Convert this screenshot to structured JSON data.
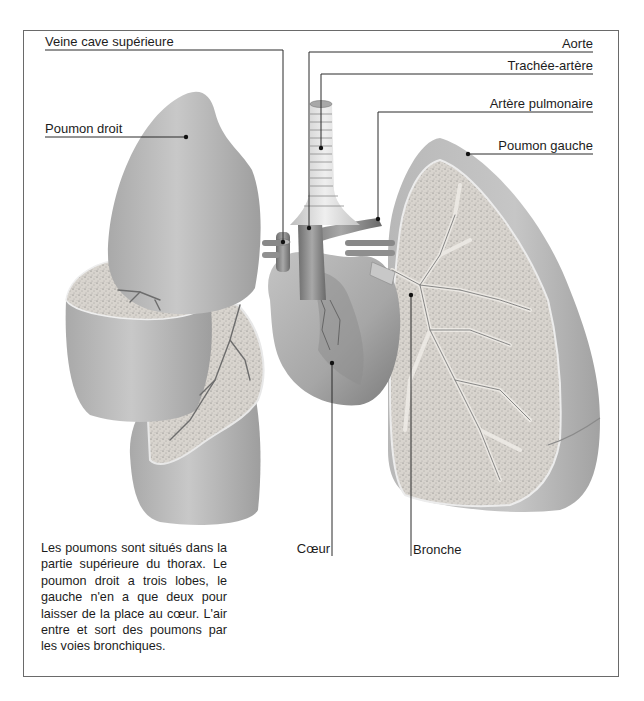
{
  "figure": {
    "labels": {
      "veine_cave_superieure": "Veine cave supérieure",
      "poumon_droit": "Poumon droit",
      "aorte": "Aorte",
      "trachee_artere": "Trachée-artère",
      "artere_pulmonaire": "Artère pulmonaire",
      "poumon_gauche": "Poumon gauche",
      "coeur": "Cœur",
      "bronche": "Bronche"
    },
    "caption": "Les poumons sont situés dans la partie supérieure du thorax. Le poumon droit a trois lobes, le gauche n'en a que deux pour laisser de la place au cœur. L'air entre et sort des poumons par les voies bronchiques.",
    "colors": {
      "frame": "#6a6a6a",
      "lung_surface": "#bdbdbd",
      "lung_cut": "#d6d2cc",
      "vessel": "#8a8a8a",
      "leader_line": "#2a2a2a"
    }
  }
}
